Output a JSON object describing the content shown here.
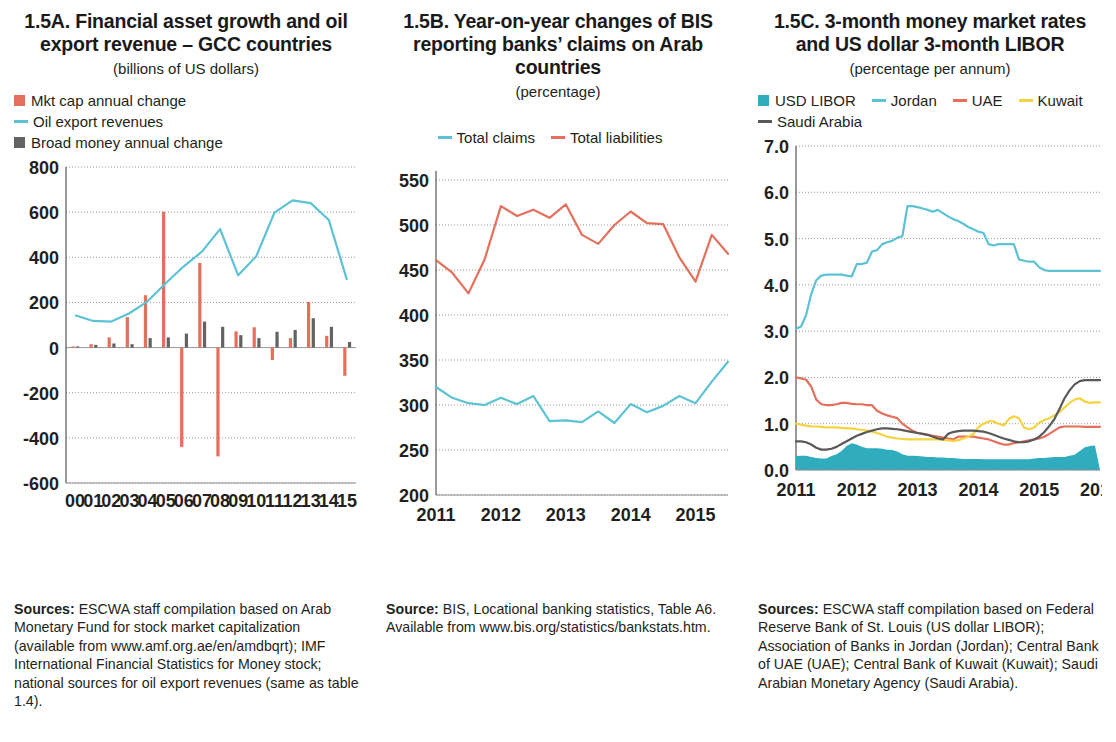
{
  "panels": [
    {
      "id": "panel-a",
      "title": "1.5A.  Financial asset growth and oil export revenue – GCC countries",
      "subtitle": "(billions of US dollars)",
      "legend": [
        {
          "label": "Mkt cap annual change",
          "marker": "square",
          "color": "#e4705c"
        },
        {
          "label": "Oil export revenues",
          "marker": "line",
          "color": "#5cc2d4"
        },
        {
          "label": "Broad money annual change",
          "marker": "square",
          "color": "#636363"
        }
      ],
      "source_label": "Sources:",
      "source_text": " ESCWA staff compilation based on Arab Monetary Fund for stock market capitalization (available from www.amf.org.ae/en/amdbqrt); IMF International Financial Statistics for Money stock; national sources for oil export revenues (same as table 1.4)."
    },
    {
      "id": "panel-b",
      "title": "1.5B.  Year-on-year changes of BIS reporting banks’ claims on Arab countries",
      "subtitle": "(percentage)",
      "legend": [
        {
          "label": "Total claims",
          "marker": "line",
          "color": "#5cc2d4"
        },
        {
          "label": "Total liabilities",
          "marker": "line",
          "color": "#e4705c"
        }
      ],
      "source_label": "Source:",
      "source_text": " BIS, Locational banking statistics, Table A6. Available from www.bis.org/statistics/bankstats.htm."
    },
    {
      "id": "panel-c",
      "title": "1.5C.  3-month money market rates and US dollar 3-month LIBOR",
      "subtitle": "(percentage per annum)",
      "legend": [
        {
          "label": "USD LIBOR",
          "marker": "square",
          "color": "#2fadbe"
        },
        {
          "label": "Jordan",
          "marker": "line",
          "color": "#5cc2d4"
        },
        {
          "label": "UAE",
          "marker": "line",
          "color": "#e4705c"
        },
        {
          "label": "Kuwait",
          "marker": "line",
          "color": "#f5d33f"
        },
        {
          "label": "Saudi Arabia",
          "marker": "line",
          "color": "#595959"
        }
      ],
      "source_label": "Sources:",
      "source_text": " ESCWA staff compilation based on Federal Reserve Bank of St. Louis (US dollar LIBOR); Association of Banks in Jordan (Jordan); Central Bank of UAE (UAE); Central Bank of Kuwait (Kuwait); Saudi Arabian Monetary Agency (Saudi Arabia)."
    }
  ],
  "chart_data": [
    {
      "type": "bar",
      "id": "1.5A",
      "title": "1.5A. Financial asset growth and oil export revenue – GCC countries",
      "subtitle": "(billions of US dollars)",
      "xlabel": "",
      "ylabel": "billions of US dollars",
      "ylim": [
        -600,
        800
      ],
      "yticks": [
        -600,
        -400,
        -200,
        0,
        200,
        400,
        600,
        800
      ],
      "grid": true,
      "legend_position": "above-plot",
      "categories": [
        "00",
        "01",
        "02",
        "03",
        "04",
        "05",
        "06",
        "07",
        "08",
        "09",
        "10",
        "11",
        "12",
        "13",
        "14",
        "15"
      ],
      "series": [
        {
          "name": "Mkt cap annual change",
          "kind": "bar",
          "color": "#e4705c",
          "values": [
            5,
            15,
            45,
            135,
            232,
            602,
            -440,
            375,
            -482,
            72,
            90,
            -55,
            42,
            202,
            52,
            -125
          ]
        },
        {
          "name": "Broad money annual change",
          "kind": "bar",
          "color": "#636363",
          "values": [
            5,
            12,
            18,
            15,
            42,
            45,
            62,
            115,
            92,
            55,
            42,
            70,
            78,
            130,
            92,
            25
          ]
        },
        {
          "name": "Oil export revenues",
          "kind": "line",
          "color": "#5cc2d4",
          "values": [
            143,
            118,
            115,
            152,
            205,
            285,
            360,
            425,
            525,
            320,
            405,
            598,
            652,
            640,
            565,
            300
          ]
        }
      ]
    },
    {
      "type": "line",
      "id": "1.5B",
      "title": "1.5B. Year-on-year changes of BIS reporting banks’ claims on Arab countries",
      "subtitle": "(percentage)",
      "xlabel": "",
      "ylabel": "percentage",
      "ylim": [
        200,
        560
      ],
      "yticks": [
        200,
        250,
        300,
        350,
        400,
        450,
        500,
        550
      ],
      "grid": true,
      "legend_position": "above-plot",
      "xticks": [
        "2011",
        "2012",
        "2013",
        "2014",
        "2015"
      ],
      "x": [
        "2011Q1",
        "2011Q2",
        "2011Q3",
        "2011Q4",
        "2012Q1",
        "2012Q2",
        "2012Q3",
        "2012Q4",
        "2013Q1",
        "2013Q2",
        "2013Q3",
        "2013Q4",
        "2014Q1",
        "2014Q2",
        "2014Q3",
        "2014Q4",
        "2015Q1",
        "2015Q2",
        "2015Q3"
      ],
      "series": [
        {
          "name": "Total liabilities",
          "color": "#e4705c",
          "values": [
            461,
            447,
            424,
            462,
            521,
            510,
            517,
            508,
            523,
            489,
            479,
            500,
            515,
            502,
            501,
            464,
            437,
            489,
            468
          ]
        },
        {
          "name": "Total claims",
          "color": "#5cc2d4",
          "values": [
            320,
            308,
            302,
            300,
            308,
            301,
            310,
            282,
            283,
            281,
            293,
            280,
            301,
            292,
            299,
            310,
            302,
            326,
            348
          ]
        }
      ]
    },
    {
      "type": "line",
      "id": "1.5C",
      "title": "1.5C. 3-month money market rates and US dollar 3-month LIBOR",
      "subtitle": "(percentage per annum)",
      "xlabel": "",
      "ylabel": "percentage per annum",
      "ylim": [
        0.0,
        7.0
      ],
      "yticks": [
        "0.0",
        "1.0",
        "2.0",
        "3.0",
        "4.0",
        "5.0",
        "6.0",
        "7.0"
      ],
      "grid": true,
      "legend_position": "above-plot",
      "xticks": [
        "2011",
        "2012",
        "2013",
        "2014",
        "2015",
        "2016"
      ],
      "x_note": "monthly, Jan 2011 – Jan 2016",
      "series": [
        {
          "name": "Jordan",
          "kind": "line",
          "color": "#5cc2d4",
          "values": [
            3.05,
            3.1,
            3.35,
            3.8,
            4.1,
            4.2,
            4.22,
            4.22,
            4.22,
            4.22,
            4.2,
            4.18,
            4.45,
            4.45,
            4.48,
            4.72,
            4.75,
            4.88,
            4.92,
            4.95,
            5.02,
            5.05,
            5.7,
            5.7,
            5.68,
            5.65,
            5.62,
            5.58,
            5.62,
            5.55,
            5.48,
            5.42,
            5.38,
            5.32,
            5.25,
            5.2,
            5.15,
            5.12,
            4.88,
            4.85,
            4.88,
            4.88,
            4.88,
            4.88,
            4.55,
            4.52,
            4.5,
            4.5,
            4.38,
            4.32,
            4.3,
            4.3,
            4.3,
            4.3,
            4.3,
            4.3,
            4.3,
            4.3,
            4.3,
            4.3,
            4.3
          ]
        },
        {
          "name": "UAE",
          "kind": "line",
          "color": "#e4705c",
          "values": [
            2.0,
            1.98,
            1.95,
            1.8,
            1.52,
            1.42,
            1.4,
            1.4,
            1.42,
            1.45,
            1.45,
            1.43,
            1.42,
            1.42,
            1.4,
            1.4,
            1.28,
            1.22,
            1.18,
            1.15,
            1.12,
            1.0,
            0.92,
            0.85,
            0.8,
            0.78,
            0.76,
            0.74,
            0.72,
            0.7,
            0.68,
            0.66,
            0.72,
            0.72,
            0.72,
            0.72,
            0.7,
            0.68,
            0.66,
            0.62,
            0.58,
            0.55,
            0.55,
            0.58,
            0.6,
            0.62,
            0.64,
            0.66,
            0.68,
            0.72,
            0.78,
            0.85,
            0.92,
            0.94,
            0.94,
            0.94,
            0.94,
            0.93,
            0.93,
            0.93,
            0.93
          ]
        },
        {
          "name": "Kuwait",
          "kind": "line",
          "color": "#f5d33f",
          "values": [
            1.0,
            0.98,
            0.96,
            0.94,
            0.94,
            0.93,
            0.92,
            0.92,
            0.92,
            0.91,
            0.9,
            0.9,
            0.88,
            0.87,
            0.85,
            0.83,
            0.8,
            0.76,
            0.72,
            0.7,
            0.68,
            0.67,
            0.66,
            0.66,
            0.66,
            0.66,
            0.66,
            0.66,
            0.66,
            0.65,
            0.64,
            0.63,
            0.64,
            0.68,
            0.72,
            0.78,
            0.92,
            1.0,
            1.05,
            1.05,
            1.0,
            0.96,
            1.1,
            1.16,
            1.12,
            0.92,
            0.88,
            0.92,
            1.02,
            1.08,
            1.12,
            1.18,
            1.25,
            1.35,
            1.45,
            1.52,
            1.55,
            1.48,
            1.45,
            1.46,
            1.46
          ]
        },
        {
          "name": "Saudi Arabia",
          "kind": "line",
          "color": "#595959",
          "values": [
            0.62,
            0.62,
            0.6,
            0.55,
            0.48,
            0.44,
            0.44,
            0.46,
            0.5,
            0.56,
            0.62,
            0.68,
            0.74,
            0.78,
            0.82,
            0.85,
            0.88,
            0.9,
            0.9,
            0.89,
            0.88,
            0.86,
            0.84,
            0.82,
            0.8,
            0.78,
            0.76,
            0.72,
            0.68,
            0.66,
            0.78,
            0.82,
            0.84,
            0.85,
            0.85,
            0.85,
            0.84,
            0.83,
            0.8,
            0.76,
            0.72,
            0.68,
            0.65,
            0.62,
            0.6,
            0.6,
            0.62,
            0.66,
            0.72,
            0.82,
            0.95,
            1.1,
            1.32,
            1.55,
            1.72,
            1.85,
            1.92,
            1.94,
            1.94,
            1.94,
            1.94
          ]
        },
        {
          "name": "USD LIBOR",
          "kind": "area",
          "color": "#2fadbe",
          "values": [
            0.3,
            0.31,
            0.31,
            0.28,
            0.26,
            0.25,
            0.25,
            0.3,
            0.34,
            0.41,
            0.52,
            0.58,
            0.55,
            0.5,
            0.47,
            0.47,
            0.47,
            0.46,
            0.44,
            0.43,
            0.4,
            0.34,
            0.31,
            0.31,
            0.3,
            0.29,
            0.28,
            0.28,
            0.27,
            0.27,
            0.26,
            0.26,
            0.25,
            0.24,
            0.24,
            0.24,
            0.24,
            0.23,
            0.23,
            0.23,
            0.23,
            0.23,
            0.23,
            0.23,
            0.23,
            0.23,
            0.23,
            0.25,
            0.26,
            0.26,
            0.27,
            0.28,
            0.28,
            0.28,
            0.31,
            0.33,
            0.41,
            0.49,
            0.52,
            0.53,
            0.0
          ]
        }
      ]
    }
  ]
}
